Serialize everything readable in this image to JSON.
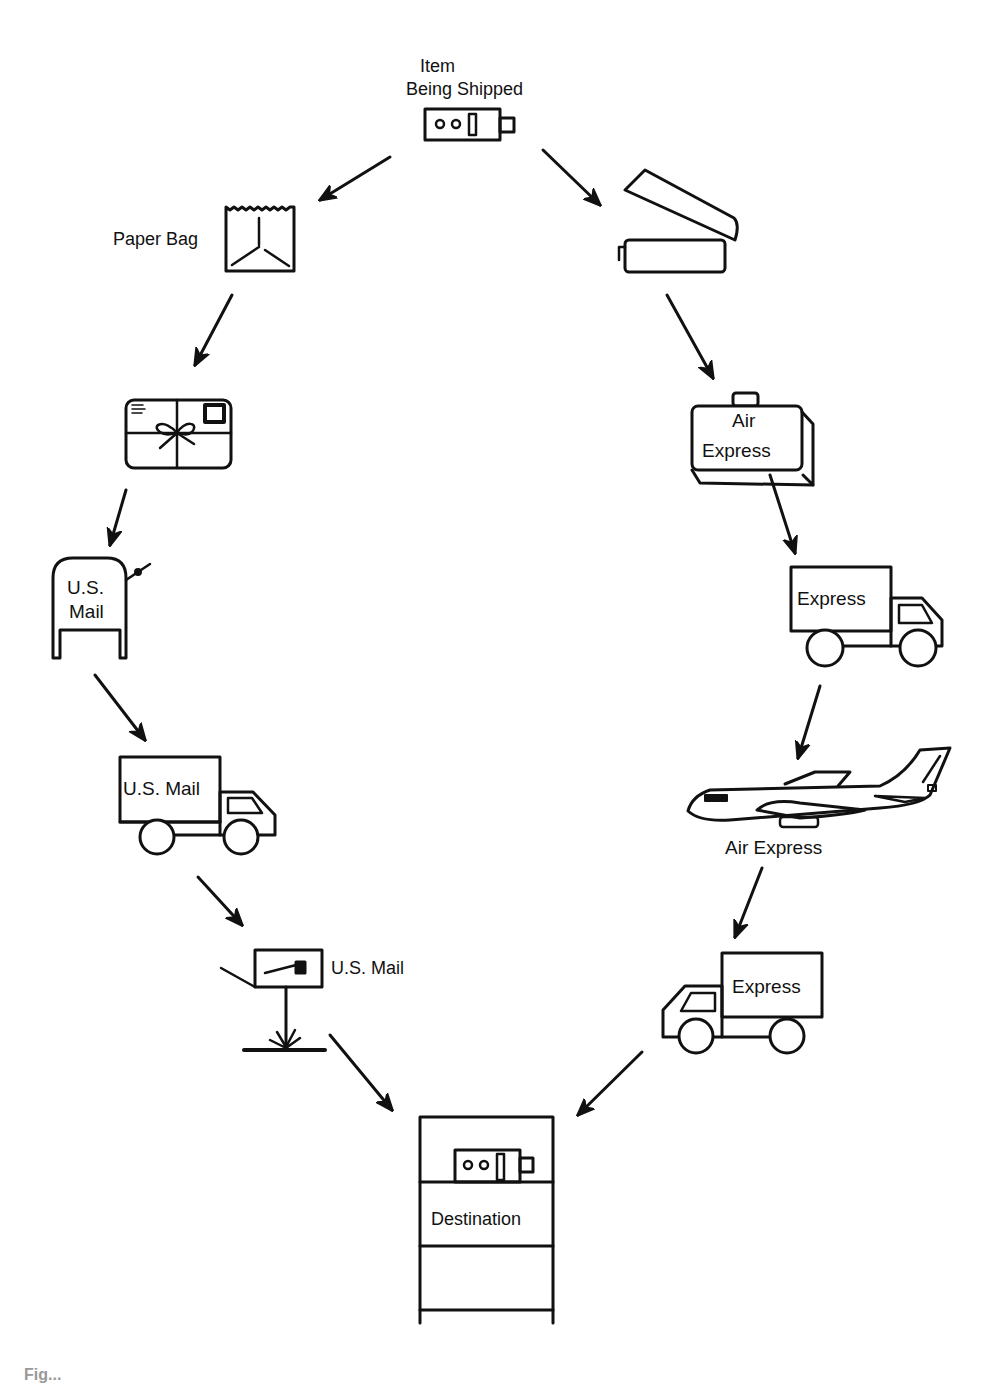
{
  "diagram": {
    "source": {
      "line1": "Item",
      "line2": "Being Shipped"
    },
    "left_path": {
      "name": "U.S. Mail route",
      "steps": [
        {
          "id": "paper-bag",
          "label": "Paper Bag"
        },
        {
          "id": "wrapped-parcel",
          "label": ""
        },
        {
          "id": "mailbox",
          "label_line1": "U.S.",
          "label_line2": "Mail"
        },
        {
          "id": "mail-truck",
          "label": "U.S. Mail"
        },
        {
          "id": "roadside-mailbox",
          "label": "U.S. Mail"
        }
      ]
    },
    "right_path": {
      "name": "Air Express route",
      "steps": [
        {
          "id": "open-box",
          "label": ""
        },
        {
          "id": "air-express-case",
          "label_line1": "Air",
          "label_line2": "Express"
        },
        {
          "id": "express-truck-1",
          "label": "Express"
        },
        {
          "id": "airplane",
          "label": "Air Express"
        },
        {
          "id": "express-truck-2",
          "label": "Express"
        }
      ]
    },
    "destination": {
      "label": "Destination"
    },
    "caption": "Fig..."
  },
  "colors": {
    "ink": "#111111",
    "background": "#ffffff"
  }
}
